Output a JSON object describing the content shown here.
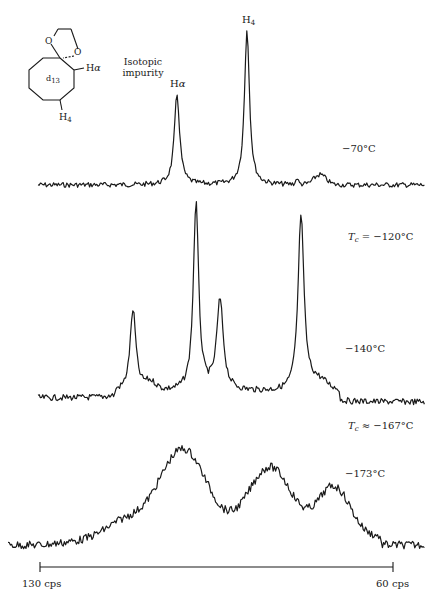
{
  "figure": {
    "molecule": {
      "ring_label": "d",
      "ring_label_sub": "13",
      "oxygen_1": "O",
      "oxygen_2": "O",
      "h_alpha": "H",
      "h_alpha_sub": "α",
      "h4": "H",
      "h4_sub": "4"
    },
    "annotation": {
      "line1": "Isotopic",
      "line2": "impurity"
    },
    "peak_labels": {
      "h_alpha": {
        "base": "H",
        "sub": "α"
      },
      "h4": {
        "base": "H",
        "sub": "4"
      }
    },
    "temperatures": {
      "t1": "−70°C",
      "tc1_symbol": "T",
      "tc1_sub": "c",
      "tc1_value": " = −120°C",
      "t2": "−140°C",
      "tc2_symbol": "T",
      "tc2_sub": "c",
      "tc2_value": " ≈ −167°C",
      "t3": "−173°C"
    },
    "scale_bar": {
      "left_label": "130 cps",
      "right_label": "60 cps"
    },
    "colors": {
      "trace": "#1a1a1a",
      "background": "#ffffff"
    }
  },
  "chart_data": {
    "type": "line",
    "title": "",
    "xlabel": "Chemical shift (cps)",
    "ylabel": "Intensity",
    "x_axis": {
      "left": 130,
      "right": 60,
      "unit": "cps",
      "reversed": true
    },
    "grid": false,
    "legend": "none",
    "series": [
      {
        "name": "−70°C",
        "description": "Two sharp lines: Hα (~100 cps) and H4 (~80 cps), small isotopic impurity bump (~67 cps)",
        "peaks": [
          {
            "label": "Hα",
            "x_cps": 100,
            "rel_height": 0.58
          },
          {
            "label": "H4",
            "x_cps": 86,
            "rel_height": 1.0
          },
          {
            "label": "Isotopic impurity",
            "x_cps": 71,
            "rel_height": 0.05
          }
        ]
      },
      {
        "name": "−140°C",
        "description": "Slow exchange, four resolved lines",
        "peaks": [
          {
            "x_cps": 111,
            "rel_height": 0.43
          },
          {
            "x_cps": 98,
            "rel_height": 0.98
          },
          {
            "x_cps": 93,
            "rel_height": 0.48
          },
          {
            "x_cps": 82,
            "rel_height": 0.9
          }
        ]
      },
      {
        "name": "−173°C",
        "description": "Broadened spectrum, three broad humps",
        "peaks": [
          {
            "x_cps": 101,
            "rel_height": 1.0
          },
          {
            "x_cps": 83,
            "rel_height": 0.8
          },
          {
            "x_cps": 71,
            "rel_height": 0.55
          }
        ]
      }
    ],
    "annotations": [
      "Isotopic impurity",
      "Tc = −120°C",
      "Tc ≈ −167°C"
    ]
  }
}
